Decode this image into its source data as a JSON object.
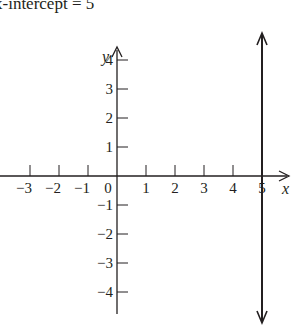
{
  "title": "x-intercept = 5",
  "colors": {
    "ink": "#231f20",
    "background": "#ffffff"
  },
  "chart_data": {
    "type": "line",
    "title": "x-intercept = 5",
    "xlabel": "x",
    "ylabel": "y",
    "xlim": [
      -3.5,
      5.8
    ],
    "ylim": [
      -5.2,
      5.1
    ],
    "grid": false,
    "x_ticks": [
      -3,
      -2,
      -1,
      0,
      1,
      2,
      3,
      4,
      5
    ],
    "x_tick_labels": [
      "−3",
      "−2",
      "−1",
      "0",
      "1",
      "2",
      "3",
      "4",
      "5"
    ],
    "y_ticks": [
      4,
      3,
      2,
      1,
      -1,
      -2,
      -3,
      -4
    ],
    "y_tick_labels": [
      "4",
      "3",
      "2",
      "1",
      "−1",
      "−2",
      "−3",
      "−4"
    ],
    "series": [
      {
        "name": "x = 5",
        "description": "vertical line through x-intercept (5, 0), arrows at both ends",
        "x": [
          5,
          5
        ],
        "y": [
          -5.2,
          5.1
        ]
      }
    ],
    "annotations": [
      "x-intercept = 5"
    ]
  }
}
